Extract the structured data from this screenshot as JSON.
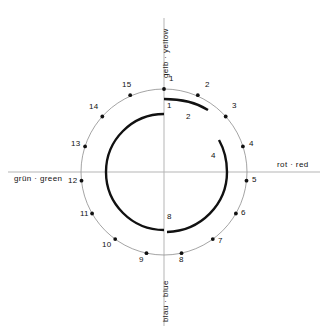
{
  "figure": {
    "type": "color-circle-spiral-diagram",
    "center": {
      "x": 164,
      "y": 172
    },
    "outer_circle_radius": 83,
    "axes": {
      "yellow": {
        "label": "gelb · yellow",
        "position": "top",
        "rotated": true
      },
      "red": {
        "label": "rot · red",
        "position": "right",
        "rotated": false
      },
      "green": {
        "label": "grün · green",
        "position": "left",
        "rotated": false
      },
      "blue": {
        "label": "blau · blue",
        "position": "bottom",
        "rotated": true
      }
    },
    "outer_points": [
      {
        "label": "1",
        "angle_deg": 0
      },
      {
        "label": "2",
        "angle_deg": 24
      },
      {
        "label": "3",
        "angle_deg": 48
      },
      {
        "label": "4",
        "angle_deg": 72
      },
      {
        "label": "5",
        "angle_deg": 96
      },
      {
        "label": "6",
        "angle_deg": 120
      },
      {
        "label": "7",
        "angle_deg": 144
      },
      {
        "label": "8",
        "angle_deg": 168
      },
      {
        "label": "9",
        "angle_deg": 192
      },
      {
        "label": "10",
        "angle_deg": 216
      },
      {
        "label": "11",
        "angle_deg": 240
      },
      {
        "label": "12",
        "angle_deg": 264
      },
      {
        "label": "13",
        "angle_deg": 288
      },
      {
        "label": "14",
        "angle_deg": 312
      },
      {
        "label": "15",
        "angle_deg": 336
      }
    ],
    "spiral_labels": [
      {
        "label": "1",
        "angle_deg": 0,
        "note": "spiral start, outer turn"
      },
      {
        "label": "2",
        "angle_deg": 24,
        "note": "outer turn"
      },
      {
        "label": "4",
        "angle_deg": 84,
        "note": "outer turn end"
      },
      {
        "label": "8",
        "angle_deg": 180,
        "note": "inner turn end"
      }
    ],
    "colors": {
      "ink": "#111111",
      "thin_line": "#9a9a9a",
      "axis_line": "#b5b5b5",
      "background": "#ffffff"
    }
  }
}
